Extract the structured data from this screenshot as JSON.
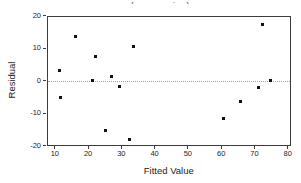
{
  "chart_data": {
    "type": "scatter",
    "title": "(response is y)",
    "xlabel": "Fitted Value",
    "ylabel": "Residual",
    "x_ticks": [
      10,
      20,
      30,
      40,
      50,
      60,
      70,
      80
    ],
    "y_ticks": [
      20,
      10,
      0,
      -10,
      -20
    ],
    "xlim": [
      7.5,
      81
    ],
    "ylim": [
      -20,
      20
    ],
    "grid": false,
    "zero_reference_line": true,
    "legend": "none",
    "points": [
      {
        "x": 11,
        "y": 3.5
      },
      {
        "x": 11.5,
        "y": -4.8
      },
      {
        "x": 16,
        "y": 13.7
      },
      {
        "x": 21,
        "y": 0.2
      },
      {
        "x": 22,
        "y": 7.7
      },
      {
        "x": 25,
        "y": -15.2
      },
      {
        "x": 26.7,
        "y": 1.6
      },
      {
        "x": 29,
        "y": -1.6
      },
      {
        "x": 32,
        "y": -17.8
      },
      {
        "x": 33.5,
        "y": 10.7
      },
      {
        "x": 60.5,
        "y": -11.3
      },
      {
        "x": 65.5,
        "y": -6.3
      },
      {
        "x": 71,
        "y": -1.7
      },
      {
        "x": 72,
        "y": 17.5
      },
      {
        "x": 74.5,
        "y": 0.3
      }
    ],
    "colors": {
      "point": "#111111",
      "frame": "#3c3c3c",
      "zero_line": "#a2a2a2",
      "text": "#1c1c1c",
      "background": "#ffffff"
    }
  }
}
